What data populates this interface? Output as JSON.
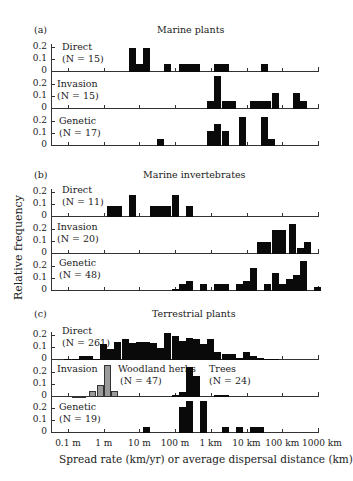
{
  "chart_data": {
    "type": "bar",
    "subtype": "histogram-panels",
    "xlabel": "Spread rate (km/yr) or average dispersal distance (km)",
    "ylabel": "Relative frequency",
    "x_scale": "log10",
    "x_tick_labels": [
      "0.1 m",
      "1 m",
      "10 m",
      "100 m",
      "1 km",
      "10 km",
      "100 km",
      "1000 km"
    ],
    "y_tick_labels": [
      "0",
      "0.1",
      "0.2"
    ],
    "ylim": [
      0,
      0.25
    ],
    "note": "Bars given as [left_decade_offset_from_0.1m_tick, width_in_decades, relative_frequency]; 1 decade per tick interval",
    "panels": [
      {
        "id": "a",
        "label": "(a)",
        "title": "Marine plants",
        "series": [
          {
            "name": "Direct",
            "n_label": "(N = 15)",
            "color": "#0a0a0a",
            "bars": [
              [
                1.7,
                0.2,
                0.2
              ],
              [
                1.9,
                0.2,
                0.07
              ],
              [
                2.1,
                0.2,
                0.2
              ],
              [
                2.7,
                0.2,
                0.07
              ],
              [
                3.1,
                0.6,
                0.07
              ],
              [
                4.1,
                0.4,
                0.07
              ],
              [
                5.4,
                0.2,
                0.07
              ]
            ]
          },
          {
            "name": "Invasion",
            "n_label": "(N = 15)",
            "color": "#0a0a0a",
            "bars": [
              [
                3.9,
                0.2,
                0.07
              ],
              [
                4.1,
                0.2,
                0.27
              ],
              [
                4.3,
                0.4,
                0.07
              ],
              [
                5.1,
                0.6,
                0.07
              ],
              [
                5.7,
                0.2,
                0.13
              ],
              [
                6.3,
                0.2,
                0.13
              ],
              [
                6.5,
                0.2,
                0.07
              ]
            ]
          },
          {
            "name": "Genetic",
            "n_label": "(N = 17)",
            "color": "#0a0a0a",
            "bars": [
              [
                2.5,
                0.2,
                0.06
              ],
              [
                3.9,
                0.2,
                0.12
              ],
              [
                4.1,
                0.2,
                0.18
              ],
              [
                4.3,
                0.2,
                0.12
              ],
              [
                4.8,
                0.2,
                0.24
              ],
              [
                5.4,
                0.2,
                0.24
              ],
              [
                5.6,
                0.2,
                0.06
              ]
            ]
          }
        ]
      },
      {
        "id": "b",
        "label": "(b)",
        "title": "Marine invertebrates",
        "series": [
          {
            "name": "Direct",
            "n_label": "(N = 11)",
            "color": "#0a0a0a",
            "bars": [
              [
                1.1,
                0.4,
                0.09
              ],
              [
                1.7,
                0.2,
                0.18
              ],
              [
                2.3,
                0.6,
                0.09
              ],
              [
                2.9,
                0.2,
                0.18
              ],
              [
                3.3,
                0.2,
                0.09
              ]
            ]
          },
          {
            "name": "Invasion",
            "n_label": "(N = 20)",
            "color": "#0a0a0a",
            "bars": [
              [
                5.3,
                0.4,
                0.1
              ],
              [
                5.7,
                0.4,
                0.2
              ],
              [
                6.2,
                0.2,
                0.25
              ],
              [
                6.4,
                0.2,
                0.05
              ],
              [
                6.6,
                0.2,
                0.1
              ]
            ]
          },
          {
            "name": "Genetic",
            "n_label": "(N = 48)",
            "color": "#0a0a0a",
            "bars": [
              [
                2.9,
                0.2,
                0.02
              ],
              [
                3.1,
                0.2,
                0.06
              ],
              [
                3.3,
                0.2,
                0.08
              ],
              [
                3.7,
                0.2,
                0.06
              ],
              [
                4.1,
                0.4,
                0.06
              ],
              [
                4.7,
                0.2,
                0.06
              ],
              [
                4.9,
                0.2,
                0.08
              ],
              [
                5.1,
                0.2,
                0.19
              ],
              [
                5.5,
                0.2,
                0.06
              ],
              [
                5.7,
                0.2,
                0.15
              ],
              [
                5.9,
                0.2,
                0.06
              ],
              [
                6.1,
                0.2,
                0.1
              ],
              [
                6.3,
                0.2,
                0.13
              ],
              [
                6.5,
                0.2,
                0.25
              ],
              [
                6.9,
                0.2,
                0.03
              ]
            ]
          }
        ]
      },
      {
        "id": "c",
        "label": "(c)",
        "title": "Terrestrial plants",
        "series": [
          {
            "name": "Direct",
            "n_label": "(N = 261)",
            "color": "#0a0a0a",
            "bars": [
              [
                -0.1,
                0.2,
                0.01
              ],
              [
                0.1,
                0.2,
                0.01
              ],
              [
                0.3,
                0.2,
                0.03
              ],
              [
                0.5,
                0.2,
                0.03
              ],
              [
                0.7,
                0.2,
                0.01
              ],
              [
                0.9,
                0.2,
                0.13
              ],
              [
                1.1,
                0.2,
                0.09
              ],
              [
                1.3,
                0.2,
                0.15
              ],
              [
                1.5,
                0.2,
                0.17
              ],
              [
                1.7,
                0.2,
                0.14
              ],
              [
                1.9,
                0.2,
                0.15
              ],
              [
                2.1,
                0.2,
                0.15
              ],
              [
                2.3,
                0.2,
                0.14
              ],
              [
                2.5,
                0.2,
                0.1
              ],
              [
                2.7,
                0.2,
                0.22
              ],
              [
                2.9,
                0.2,
                0.2
              ],
              [
                3.1,
                0.2,
                0.16
              ],
              [
                3.3,
                0.2,
                0.18
              ],
              [
                3.5,
                0.2,
                0.17
              ],
              [
                3.7,
                0.2,
                0.13
              ],
              [
                3.9,
                0.2,
                0.17
              ],
              [
                4.1,
                0.2,
                0.07
              ],
              [
                4.3,
                0.4,
                0.05
              ],
              [
                4.7,
                0.2,
                0.02
              ],
              [
                4.9,
                0.2,
                0.07
              ],
              [
                5.1,
                0.2,
                0.03
              ],
              [
                5.3,
                0.2,
                0.02
              ],
              [
                5.5,
                0.4,
                0.01
              ]
            ]
          },
          {
            "name": "Invasion — Woodland herbs",
            "n_label": "(N = 47)",
            "color": "#9a9a9a",
            "bars": [
              [
                0.1,
                0.4,
                0.005
              ],
              [
                0.6,
                0.2,
                0.05
              ],
              [
                0.8,
                0.2,
                0.1
              ],
              [
                1.0,
                0.2,
                0.26
              ],
              [
                1.2,
                0.2,
                0.05
              ]
            ]
          },
          {
            "name": "Invasion — Trees",
            "n_label": "(N = 24)",
            "color": "#0a0a0a",
            "bars": [
              [
                2.9,
                0.2,
                0.02
              ],
              [
                3.1,
                0.2,
                0.04
              ],
              [
                3.3,
                0.2,
                0.25
              ],
              [
                3.5,
                0.2,
                0.17
              ],
              [
                4.1,
                0.4,
                0.02
              ]
            ]
          },
          {
            "name": "Genetic",
            "n_label": "(N = 19)",
            "color": "#0a0a0a",
            "bars": [
              [
                2.1,
                0.2,
                0.05
              ],
              [
                3.1,
                0.2,
                0.21
              ],
              [
                3.3,
                0.2,
                0.26
              ],
              [
                3.7,
                0.2,
                0.26
              ],
              [
                4.3,
                0.2,
                0.05
              ],
              [
                4.7,
                0.2,
                0.05
              ],
              [
                5.1,
                0.4,
                0.05
              ]
            ]
          }
        ]
      }
    ]
  },
  "labels": {
    "ylabel": "Relative frequency",
    "xlabel": "Spread rate (km/yr) or average dispersal distance (km)",
    "yticks": [
      "0",
      "0.1",
      "0.2"
    ],
    "xticks": [
      "0.1 m",
      "1 m",
      "10 m",
      "100 m",
      "1 km",
      "10 km",
      "100 km",
      "1000 km"
    ],
    "panel_a": {
      "label": "(a)",
      "title": "Marine plants",
      "s0": "Direct",
      "n0": "(N = 15)",
      "s1": "Invasion",
      "n1": "(N = 15)",
      "s2": "Genetic",
      "n2": "(N = 17)"
    },
    "panel_b": {
      "label": "(b)",
      "title": "Marine invertebrates",
      "s0": "Direct",
      "n0": "(N = 11)",
      "s1": "Invasion",
      "n1": "(N = 20)",
      "s2": "Genetic",
      "n2": "(N = 48)"
    },
    "panel_c": {
      "label": "(c)",
      "title": "Terrestrial plants",
      "s0": "Direct",
      "n0": "(N = 261)",
      "s1": "Invasion",
      "s1b": "Woodland herbs",
      "n1b": "(N = 47)",
      "s1c": "Trees",
      "n1c": "(N = 24)",
      "s2": "Genetic",
      "n2": "(N = 19)"
    }
  }
}
